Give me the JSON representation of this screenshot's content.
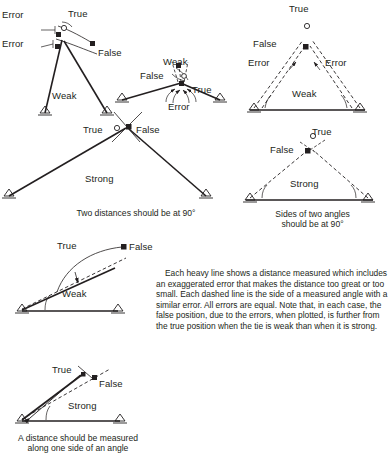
{
  "page": {
    "ink_color": "#231f20",
    "background_color": "#ffffff"
  },
  "diagrams": [
    {
      "id": "weak-two-distances",
      "tie_strength": "Weak",
      "labels": {
        "true_point": "True",
        "false_point": "False",
        "error_upper": "Error",
        "error_lower": "Error",
        "tie_strength": "Weak"
      }
    },
    {
      "id": "weak-two-angles",
      "tie_strength": "Weak",
      "labels": {
        "true_point": "True",
        "false_point": "False",
        "error": "Error",
        "tie_strength": "Weak"
      }
    },
    {
      "id": "weak-angle-sides",
      "tie_strength": "Weak",
      "labels": {
        "true_point": "True",
        "false_point": "False",
        "error_left": "Error",
        "error_right": "Error",
        "tie_strength": "Weak"
      }
    },
    {
      "id": "strong-two-distances",
      "tie_strength": "Strong",
      "labels": {
        "true_point": "True",
        "false_point": "False",
        "tie_strength": "Strong"
      }
    },
    {
      "id": "strong-angle-sides",
      "tie_strength": "Strong",
      "labels": {
        "true_point": "True",
        "false_point": "False",
        "tie_strength": "Strong"
      }
    },
    {
      "id": "weak-distance-along-angle",
      "tie_strength": "Weak",
      "labels": {
        "true_point": "True",
        "false_point": "False",
        "tie_strength": "Weak"
      }
    },
    {
      "id": "strong-distance-along-angle",
      "tie_strength": "Strong",
      "labels": {
        "true_point": "True",
        "false_point": "False",
        "tie_strength": "Strong"
      }
    }
  ],
  "captions": {
    "two_distances": "Two distances should be at 90°",
    "sides_of_two_angles_line1": "Sides of two angles",
    "sides_of_two_angles_line2": "should be at 90°",
    "distance_along_angle_line1": "A distance should be measured",
    "distance_along_angle_line2": "along one side of an angle"
  },
  "explanation": {
    "text": "Each heavy line shows a distance measured which includes an exaggerated error that makes the distance too great or too small. Each dashed line is the side of a measured angle with a similar error.  All errors are equal.  Note that, in each case, the false position, due to the errors, when plotted, is further from the true position when the tie is weak than when it is strong."
  }
}
